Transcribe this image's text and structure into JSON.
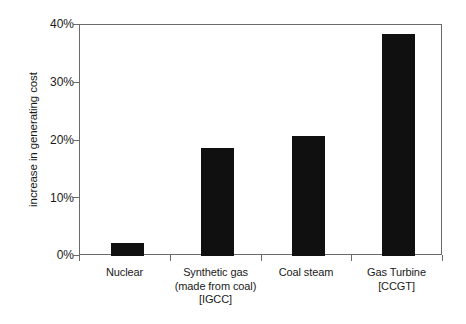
{
  "chart_data": {
    "type": "bar",
    "title": "",
    "subtitle": "",
    "xlabel": "",
    "ylabel": "increase in generating cost",
    "categories": [
      "Nuclear",
      "Synthetic gas\n(made from coal)\n[IGCC]",
      "Coal steam",
      "Gas Turbine\n[CCGT]"
    ],
    "values": [
      2.2,
      18.7,
      20.8,
      38.4
    ],
    "value_unit": "%",
    "ylim": [
      0,
      40
    ],
    "yticks": [
      0,
      10,
      20,
      30,
      40
    ],
    "ytick_labels": [
      "0%",
      "10%",
      "20%",
      "30%",
      "40%"
    ],
    "grid": false,
    "legend": "none",
    "bar_color": "#101010",
    "axis_color": "#6a6a6a",
    "background_color": "#ffffff"
  },
  "axes": {
    "y_title": "increase in generating cost",
    "y_tick_labels": [
      "40%",
      "30%",
      "20%",
      "10%",
      "0%"
    ]
  },
  "categories": [
    {
      "label": "Nuclear",
      "value": 2.2
    },
    {
      "label": "Synthetic gas\n(made from coal)\n[IGCC]",
      "value": 18.7
    },
    {
      "label": "Coal steam",
      "value": 20.8
    },
    {
      "label": "Gas Turbine\n[CCGT]",
      "value": 38.4
    }
  ]
}
